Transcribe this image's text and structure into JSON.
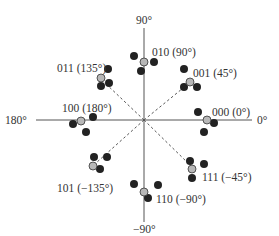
{
  "diagram": {
    "type": "8-PSK constellation with noisy received points",
    "axis_labels": {
      "top": "90°",
      "bottom": "−90°",
      "left": "180°",
      "right": "0°"
    },
    "symbols": [
      {
        "bits": "000",
        "angle_deg": 0,
        "label": "000 (0°)"
      },
      {
        "bits": "001",
        "angle_deg": 45,
        "label": "001 (45°)"
      },
      {
        "bits": "010",
        "angle_deg": 90,
        "label": "010 (90°)"
      },
      {
        "bits": "011",
        "angle_deg": 135,
        "label": "011 (135°)"
      },
      {
        "bits": "100",
        "angle_deg": 180,
        "label": "100 (180°)"
      },
      {
        "bits": "101",
        "angle_deg": -135,
        "label": "101 (−135°)"
      },
      {
        "bits": "110",
        "angle_deg": -90,
        "label": "110 (−90°)"
      },
      {
        "bits": "111",
        "angle_deg": -45,
        "label": "111 (−45°)"
      }
    ],
    "colors": {
      "reference_point": "#b8b8b8",
      "received_point": "#222222",
      "axis": "#555555",
      "text": "#333333"
    }
  }
}
